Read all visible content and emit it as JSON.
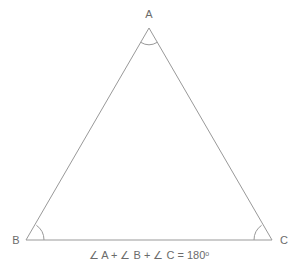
{
  "figure": {
    "type": "triangle-angle-sum-diagram",
    "background_color": "#ffffff",
    "stroke_color": "#999999",
    "text_color": "#6b6b6b",
    "vertices": {
      "a": {
        "label": "A",
        "x": 149,
        "y": 28
      },
      "b": {
        "label": "B",
        "x": 26,
        "y": 240
      },
      "c": {
        "label": "C",
        "x": 272,
        "y": 240
      }
    },
    "angle_marks": {
      "a_radius": 16,
      "b_radius": 18,
      "c_radius": 18
    },
    "caption": {
      "prefix": "∠ A + ∠ B + ∠ C = 180",
      "degree": "o"
    }
  }
}
